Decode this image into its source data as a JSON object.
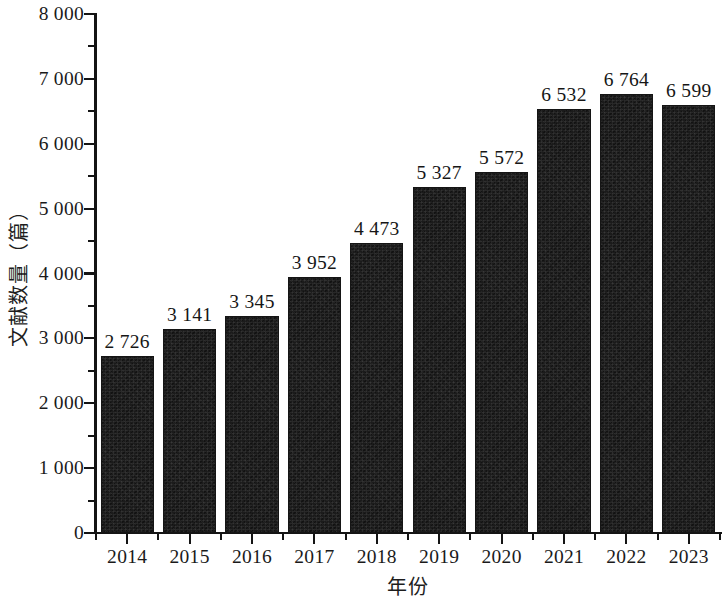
{
  "chart_data": {
    "type": "bar",
    "title": "",
    "subtitle": "",
    "xlabel": "年份",
    "ylabel": "文献数量（篇）",
    "categories": [
      "2014",
      "2015",
      "2016",
      "2017",
      "2018",
      "2019",
      "2020",
      "2021",
      "2022",
      "2023"
    ],
    "values": [
      2726,
      3141,
      3345,
      3952,
      4473,
      5327,
      5572,
      6532,
      6764,
      6599
    ],
    "value_labels": [
      "2 726",
      "3 141",
      "3 345",
      "3 952",
      "4 473",
      "5 327",
      "5 572",
      "6 532",
      "6 764",
      "6 599"
    ],
    "ylim": [
      0,
      8000
    ],
    "xlim_categories": 10,
    "y_tick_values": [
      0,
      1000,
      2000,
      3000,
      4000,
      5000,
      6000,
      7000,
      8000
    ],
    "y_tick_labels": [
      "0",
      "1 000",
      "2 000",
      "3 000",
      "4 000",
      "5 000",
      "6 000",
      "7 000",
      "8 000"
    ],
    "y_minor_tick_values": [
      500,
      1500,
      2500,
      3500,
      4500,
      5500,
      6500,
      7500
    ],
    "grid": false,
    "legend": null,
    "legend_position": "none",
    "bar_color": "#1b1b1b",
    "axis_color": "#141414",
    "text_color": "#1a1a1a",
    "background_color": "#ffffff",
    "show_value_labels": true,
    "thousands_separator": " "
  }
}
